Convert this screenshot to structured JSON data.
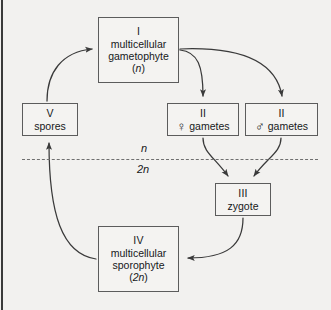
{
  "figure": {
    "background_color": "#f2f1ef",
    "border_color": "#3a3a3a",
    "box_border_color": "#5c5c5c",
    "text_color": "#16181a"
  },
  "divider": {
    "style": "dashed",
    "color": "#6f6f6f",
    "haploid_label": "n",
    "diploid_label": "2n"
  },
  "nodes": [
    {
      "id": "gametophyte",
      "roman": "I",
      "line1": "multicellular",
      "line2": "gametophyte",
      "ploidy_open": "(",
      "ploidy": "n",
      "ploidy_close": ")"
    },
    {
      "id": "spores",
      "roman": "V",
      "line1": "spores"
    },
    {
      "id": "female-gametes",
      "roman": "II",
      "symbol": "♀",
      "symbol_name": "female-symbol",
      "line1": "gametes"
    },
    {
      "id": "male-gametes",
      "roman": "II",
      "symbol": "♂",
      "symbol_name": "male-symbol",
      "line1": "gametes"
    },
    {
      "id": "zygote",
      "roman": "III",
      "line1": "zygote"
    },
    {
      "id": "sporophyte",
      "roman": "IV",
      "line1": "multicellular",
      "line2": "sporophyte",
      "ploidy_open": "(",
      "ploidy": "2n",
      "ploidy_close": ")"
    }
  ],
  "arrows": [
    {
      "id": "spores-to-gametophyte",
      "from": "spores",
      "to": "gametophyte"
    },
    {
      "id": "gametophyte-to-female",
      "from": "gametophyte",
      "to": "female-gametes"
    },
    {
      "id": "gametophyte-to-male",
      "from": "gametophyte",
      "to": "male-gametes"
    },
    {
      "id": "female-to-zygote",
      "from": "female-gametes",
      "to": "zygote"
    },
    {
      "id": "male-to-zygote",
      "from": "male-gametes",
      "to": "zygote"
    },
    {
      "id": "zygote-to-sporophyte",
      "from": "zygote",
      "to": "sporophyte"
    },
    {
      "id": "sporophyte-to-spores",
      "from": "sporophyte",
      "to": "spores"
    }
  ]
}
